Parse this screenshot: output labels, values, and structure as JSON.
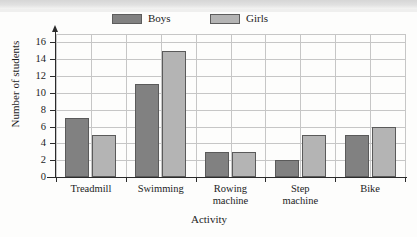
{
  "chart_data": {
    "type": "bar",
    "title": "",
    "xlabel": "Activity",
    "ylabel": "Number of students",
    "categories": [
      "Treadmill",
      "Swimming",
      "Rowing machine",
      "Step machine",
      "Bike"
    ],
    "category_lines": [
      [
        "Treadmill"
      ],
      [
        "Swimming"
      ],
      [
        "Rowing",
        "machine"
      ],
      [
        "Step",
        "machine"
      ],
      [
        "Bike"
      ]
    ],
    "series": [
      {
        "name": "Boys",
        "color": "#818181",
        "values": [
          7,
          11,
          3,
          2,
          5
        ]
      },
      {
        "name": "Girls",
        "color": "#b4b4b4",
        "values": [
          5,
          15,
          3,
          5,
          6
        ]
      }
    ],
    "ylim": [
      0,
      17
    ],
    "yticks": [
      0,
      2,
      4,
      6,
      8,
      10,
      12,
      14,
      16
    ],
    "ytick_labels": [
      "0",
      "2",
      "4",
      "6",
      "8",
      "10",
      "12",
      "14",
      "16"
    ],
    "grid": true,
    "grid_color": "#c6c6c6",
    "legend_position": "top",
    "axis_color": "#2b2b2b",
    "bar_border_color": "#5a5a5a",
    "background": "#fdfdfc"
  },
  "legend": {
    "items": [
      {
        "label": "Boys",
        "swatch": "#818181"
      },
      {
        "label": "Girls",
        "swatch": "#b4b4b4"
      }
    ]
  }
}
